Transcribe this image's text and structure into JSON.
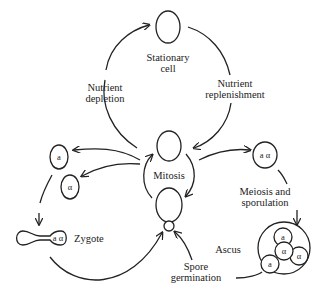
{
  "diagram": {
    "nodes": {
      "stationary_cell": {
        "label_line1": "Stationary",
        "label_line2": "cell"
      },
      "mitosis": {
        "label": "Mitosis"
      },
      "haploid_a": {
        "label": "a"
      },
      "haploid_alpha": {
        "label": "α"
      },
      "zygote": {
        "label": "Zygote",
        "nucleus_label": "a α"
      },
      "diploid": {
        "label": "a α"
      },
      "ascus": {
        "label": "Ascus",
        "spores": [
          "a",
          "α",
          "α",
          "a"
        ]
      }
    },
    "edges": {
      "nutrient_depletion": {
        "line1": "Nutrient",
        "line2": "depletion"
      },
      "nutrient_replenishment": {
        "line1": "Nutrient",
        "line2": "replenishment"
      },
      "meiosis_sporulation": {
        "line1": "Meiosis and",
        "line2": "sporulation"
      },
      "spore_germination": {
        "line1": "Spore",
        "line2": "germination"
      }
    }
  }
}
